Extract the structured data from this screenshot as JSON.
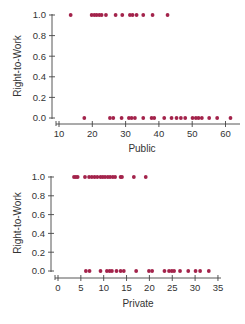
{
  "chart_data": [
    {
      "type": "scatter",
      "title": "",
      "xlabel": "Public",
      "ylabel": "Right-to-Work",
      "xlim": [
        8,
        63
      ],
      "ylim": [
        0,
        1
      ],
      "xticks": [
        10,
        20,
        30,
        40,
        50,
        60
      ],
      "yticks": [
        "0.0",
        "0.2",
        "0.4",
        "0.6",
        "0.8",
        "1.0"
      ],
      "grid": false,
      "legend": null,
      "point_color": "#a3234b",
      "series": [
        {
          "name": "Right-to-Work = 1",
          "y": 1.0,
          "x": [
            13.5,
            19.8,
            20.6,
            21.3,
            22.1,
            22.8,
            24.1,
            27.0,
            29.0,
            31.3,
            32.1,
            33.3,
            35.3,
            38.1,
            42.6
          ]
        },
        {
          "name": "Right-to-Work = 0",
          "y": 0.0,
          "x": [
            17.6,
            25.3,
            26.3,
            28.8,
            31.0,
            31.8,
            32.8,
            35.3,
            37.8,
            38.6,
            41.6,
            43.8,
            45.3,
            46.6,
            47.9,
            50.1,
            51.1,
            51.9,
            52.9,
            55.1,
            57.5,
            61.5
          ]
        }
      ]
    },
    {
      "type": "scatter",
      "title": "",
      "xlabel": "Private",
      "ylabel": "Right-to-Work",
      "xlim": [
        -1,
        36
      ],
      "ylim": [
        0,
        1
      ],
      "xticks": [
        0,
        5,
        10,
        15,
        20,
        25,
        30,
        35
      ],
      "yticks": [
        "0.0",
        "0.2",
        "0.4",
        "0.6",
        "0.8",
        "1.0"
      ],
      "grid": false,
      "legend": null,
      "point_color": "#a3234b",
      "series": [
        {
          "name": "Right-to-Work = 1",
          "y": 1.0,
          "x": [
            3.5,
            3.9,
            4.3,
            5.9,
            6.8,
            7.4,
            8.0,
            8.6,
            9.3,
            9.8,
            10.3,
            10.9,
            11.4,
            12.0,
            12.5,
            13.7,
            14.0,
            16.6,
            19.2
          ]
        },
        {
          "name": "Right-to-Work = 0",
          "y": 0.0,
          "x": [
            6.1,
            6.9,
            9.3,
            10.7,
            11.3,
            11.8,
            12.8,
            13.7,
            14.4,
            17.1,
            19.9,
            20.6,
            23.3,
            24.3,
            24.9,
            25.4,
            26.7,
            28.5,
            30.1,
            31.1,
            33.0
          ]
        }
      ]
    }
  ],
  "charts": [
    {
      "xlabel": "Public",
      "ylabel": "Right-to-Work"
    },
    {
      "xlabel": "Private",
      "ylabel": "Right-to-Work"
    }
  ]
}
